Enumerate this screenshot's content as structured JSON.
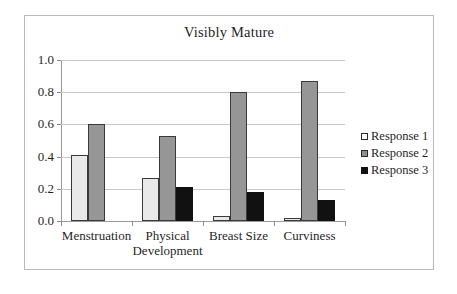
{
  "chart_data": {
    "type": "bar",
    "title": "Visibly Mature",
    "xlabel": "",
    "ylabel": "",
    "ylim": [
      0,
      1.0
    ],
    "yticks": [
      "0.0",
      "0.2",
      "0.4",
      "0.6",
      "0.8",
      "1.0"
    ],
    "ytick_values": [
      0.0,
      0.2,
      0.4,
      0.6,
      0.8,
      1.0
    ],
    "grid": true,
    "legend_position": "right",
    "categories": [
      "Menstruation",
      "Physical Development",
      "Breast Size",
      "Curviness"
    ],
    "category_lines": [
      [
        "Menstruation"
      ],
      [
        "Physical",
        "Development"
      ],
      [
        "Breast Size"
      ],
      [
        "Curviness"
      ]
    ],
    "series": [
      {
        "name": "Response 1",
        "color": "#e9e9e9",
        "values": [
          0.41,
          0.27,
          0.03,
          0.02
        ]
      },
      {
        "name": "Response 2",
        "color": "#969696",
        "values": [
          0.6,
          0.53,
          0.8,
          0.87
        ]
      },
      {
        "name": "Response 3",
        "color": "#111111",
        "values": [
          0.0,
          0.21,
          0.18,
          0.13
        ]
      }
    ]
  },
  "legend": {
    "items": [
      {
        "label": "Response 1",
        "swatch": "legend-swatch-response-1"
      },
      {
        "label": "Response 2",
        "swatch": "legend-swatch-response-2"
      },
      {
        "label": "Response 3",
        "swatch": "legend-swatch-response-3"
      }
    ]
  }
}
